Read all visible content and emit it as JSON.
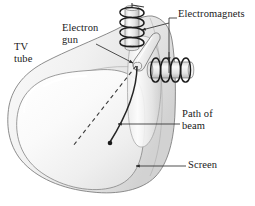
{
  "figure": {
    "background_color": "#ffffff",
    "text_color": "#1a1a1a",
    "glass_fill_light": "#f7f7f7",
    "glass_fill_mid": "#eaeaea",
    "glass_fill_dark": "#d9d9d9",
    "outline_color": "#6e6e6e",
    "coil_color": "#1c1c1c",
    "beam_color": "#262626",
    "leader_color": "#3a3a3a"
  },
  "labels": {
    "electromagnets": "Electromagnets",
    "electron_gun": "Electron\ngun",
    "tv_tube": "TV\ntube",
    "path_of_beam": "Path of\nbeam",
    "screen": "Screen"
  },
  "parts": {
    "tube_body": "tv-tube-glass-envelope",
    "screen_face": "screen-front-face",
    "electron_gun": "electron-gun-capsule",
    "vertical_coil": "vertical-deflection-electromagnet",
    "horizontal_coil": "horizontal-deflection-electromagnet",
    "beam_path": "curved-electron-beam",
    "undeflected_path": "dashed-undeflected-beam",
    "beam_endpoint": "beam-impact-dot"
  }
}
